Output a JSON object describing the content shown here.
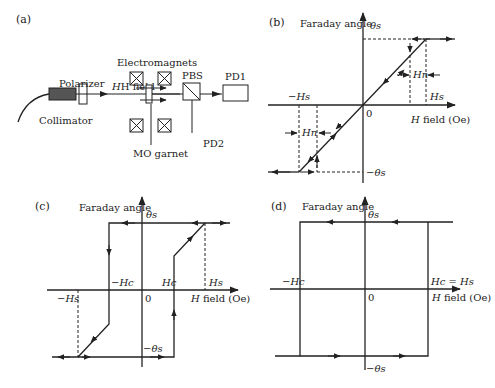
{
  "panels": {
    "a": {
      "label": "(a)",
      "components": {
        "collimator": "Collimator",
        "polarizer": "Polarizer",
        "electromagnets": "Electromagnets",
        "h_field": "H field",
        "mo_garnet": "MO garnet",
        "pbs": "PBS",
        "pd1": "PD1",
        "pd2": "PD2"
      }
    },
    "b": {
      "label": "(b)",
      "y_axis_label": "Faraday angle",
      "x_axis_label": "H field (Oe)",
      "origin": "0",
      "theta_s": "θs",
      "neg_theta_s": "−θs",
      "h_s": "Hs",
      "neg_h_s": "−Hs",
      "h_n_right": "Hn",
      "h_n_left": "Hn"
    },
    "c": {
      "label": "(c)",
      "y_axis_label": "Faraday angle",
      "x_axis_label": "H field (Oe)",
      "origin": "0",
      "theta_s": "θs",
      "neg_theta_s": "−θs",
      "h_c": "Hc",
      "neg_h_c": "−Hc",
      "h_s": "Hs",
      "neg_h_s": "−Hs"
    },
    "d": {
      "label": "(d)",
      "y_axis_label": "Faraday angle",
      "x_axis_label": "H field (Oe)",
      "origin": "0",
      "theta_s": "θs",
      "neg_theta_s": "−θs",
      "neg_h_c": "−Hc",
      "hc_eq_hs": "Hc = Hs"
    }
  }
}
